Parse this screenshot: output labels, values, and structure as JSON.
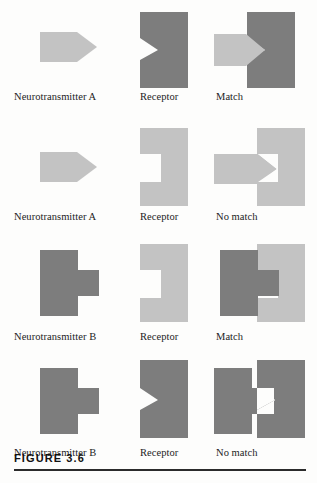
{
  "figure": {
    "caption": "FIGURE 3.6",
    "colors": {
      "dark_gray": "#7d7d7d",
      "light_gray": "#c3c3c3",
      "paper": "#fdfdfc",
      "text": "#1c1c1c",
      "rule": "#2b2b2b"
    }
  },
  "rows": [
    {
      "id": "row-1",
      "cells": [
        {
          "id": "r1c1",
          "label": "Neurotransmitter A",
          "shape": "arrow",
          "tone": "light"
        },
        {
          "id": "r1c2",
          "label": "Receptor",
          "shape": "receptor-v-notch",
          "tone": "dark"
        },
        {
          "id": "r1c3",
          "label": "Match",
          "shape": "fit-arrow-into-v",
          "tone": "mixed"
        }
      ]
    },
    {
      "id": "row-2",
      "cells": [
        {
          "id": "r2c1",
          "label": "Neurotransmitter A",
          "shape": "arrow",
          "tone": "light"
        },
        {
          "id": "r2c2",
          "label": "Receptor",
          "shape": "receptor-square-notch",
          "tone": "light"
        },
        {
          "id": "r2c3",
          "label": "No match",
          "shape": "arrow-vs-square-notch",
          "tone": "light"
        }
      ]
    },
    {
      "id": "row-3",
      "cells": [
        {
          "id": "r3c1",
          "label": "Neurotransmitter B",
          "shape": "tee",
          "tone": "dark"
        },
        {
          "id": "r3c2",
          "label": "Receptor",
          "shape": "receptor-square-notch",
          "tone": "light"
        },
        {
          "id": "r3c3",
          "label": "Match",
          "shape": "fit-tee-into-square",
          "tone": "mixed"
        }
      ]
    },
    {
      "id": "row-4",
      "cells": [
        {
          "id": "r4c1",
          "label": "Neurotransmitter B",
          "shape": "tee",
          "tone": "dark"
        },
        {
          "id": "r4c2",
          "label": "Receptor",
          "shape": "receptor-v-notch",
          "tone": "dark"
        },
        {
          "id": "r4c3",
          "label": "No match",
          "shape": "tee-vs-v-notch",
          "tone": "dark"
        }
      ]
    }
  ]
}
